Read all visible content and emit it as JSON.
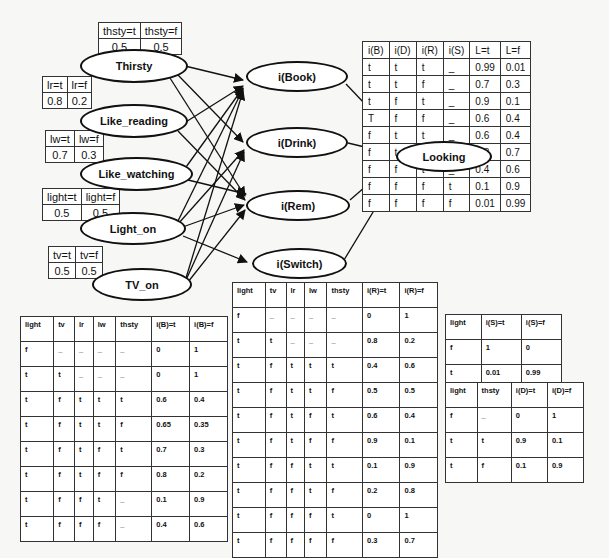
{
  "diagram": {
    "type": "bayesian_network",
    "nodes": {
      "thirsty": "Thirsty",
      "like_reading": "Like_reading",
      "like_watching": "Like_watching",
      "light_on": "Light_on",
      "tv_on": "TV_on",
      "i_book": "i(Book)",
      "i_drink": "i(Drink)",
      "i_rem": "i(Rem)",
      "i_switch": "i(Switch)",
      "looking": "Looking"
    },
    "edges": [
      [
        "Thirsty",
        "i(Book)"
      ],
      [
        "Thirsty",
        "i(Drink)"
      ],
      [
        "Thirsty",
        "i(Rem)"
      ],
      [
        "Like_reading",
        "i(Book)"
      ],
      [
        "Like_reading",
        "i(Rem)"
      ],
      [
        "Like_watching",
        "i(Book)"
      ],
      [
        "Like_watching",
        "i(Rem)"
      ],
      [
        "Light_on",
        "i(Book)"
      ],
      [
        "Light_on",
        "i(Drink)"
      ],
      [
        "Light_on",
        "i(Rem)"
      ],
      [
        "Light_on",
        "i(Switch)"
      ],
      [
        "TV_on",
        "i(Book)"
      ],
      [
        "TV_on",
        "i(Drink)"
      ],
      [
        "TV_on",
        "i(Rem)"
      ],
      [
        "i(Book)",
        "Looking"
      ],
      [
        "i(Drink)",
        "Looking"
      ],
      [
        "i(Rem)",
        "Looking"
      ],
      [
        "i(Switch)",
        "Looking"
      ]
    ]
  },
  "priors": {
    "thirsty": {
      "headers": [
        "thsty=t",
        "thsty=f"
      ],
      "values": [
        "0.5",
        "0.5"
      ]
    },
    "like_reading": {
      "headers": [
        "lr=t",
        "lr=f"
      ],
      "values": [
        "0.8",
        "0.2"
      ]
    },
    "like_watching": {
      "headers": [
        "lw=t",
        "lw=f"
      ],
      "values": [
        "0.7",
        "0.3"
      ]
    },
    "light_on": {
      "headers": [
        "light=t",
        "light=f"
      ],
      "values": [
        "0.5",
        "0.5"
      ]
    },
    "tv_on": {
      "headers": [
        "tv=t",
        "tv=f"
      ],
      "values": [
        "0.5",
        "0.5"
      ]
    }
  },
  "looking_table": {
    "headers": [
      "i(B)",
      "i(D)",
      "i(R)",
      "i(S)",
      "L=t",
      "L=f"
    ],
    "rows": [
      [
        "t",
        "t",
        "t",
        "_",
        "0.99",
        "0.01"
      ],
      [
        "t",
        "t",
        "f",
        "_",
        "0.7",
        "0.3"
      ],
      [
        "t",
        "f",
        "t",
        "_",
        "0.9",
        "0.1"
      ],
      [
        "T",
        "f",
        "f",
        "_",
        "0.6",
        "0.4"
      ],
      [
        "f",
        "t",
        "t",
        "_",
        "0.6",
        "0.4"
      ],
      [
        "f",
        "t",
        "f",
        "_",
        "0.3",
        "0.7"
      ],
      [
        "f",
        "f",
        "t",
        "_",
        "0.4",
        "0.6"
      ],
      [
        "f",
        "f",
        "f",
        "t",
        "0.1",
        "0.9"
      ],
      [
        "f",
        "f",
        "f",
        "f",
        "0.01",
        "0.99"
      ]
    ]
  },
  "book_table": {
    "headers": [
      "light",
      "tv",
      "lr",
      "lw",
      "thsty",
      "i(B)=t",
      "i(B)=f"
    ],
    "rows": [
      [
        "f",
        "_",
        "_",
        "_",
        "_",
        "0",
        "1"
      ],
      [
        "t",
        "t",
        "_",
        "_",
        "_",
        "0",
        "1"
      ],
      [
        "t",
        "f",
        "t",
        "t",
        "t",
        "0.6",
        "0.4"
      ],
      [
        "t",
        "f",
        "t",
        "t",
        "f",
        "0.65",
        "0.35"
      ],
      [
        "t",
        "f",
        "t",
        "f",
        "t",
        "0.7",
        "0.3"
      ],
      [
        "t",
        "f",
        "t",
        "f",
        "f",
        "0.8",
        "0.2"
      ],
      [
        "t",
        "f",
        "f",
        "t",
        "_",
        "0.1",
        "0.9"
      ],
      [
        "t",
        "f",
        "f",
        "f",
        "_",
        "0.4",
        "0.6"
      ]
    ]
  },
  "rem_table": {
    "headers": [
      "light",
      "tv",
      "lr",
      "lw",
      "thsty",
      "i(R)=t",
      "i(R)=f"
    ],
    "rows": [
      [
        "f",
        "_",
        "_",
        "_",
        "_",
        "0",
        "1"
      ],
      [
        "t",
        "t",
        "_",
        "_",
        "_",
        "0.8",
        "0.2"
      ],
      [
        "t",
        "f",
        "t",
        "t",
        "t",
        "0.4",
        "0.6"
      ],
      [
        "t",
        "f",
        "t",
        "t",
        "f",
        "0.5",
        "0.5"
      ],
      [
        "t",
        "f",
        "t",
        "f",
        "t",
        "0.6",
        "0.4"
      ],
      [
        "t",
        "f",
        "t",
        "f",
        "f",
        "0.9",
        "0.1"
      ],
      [
        "t",
        "f",
        "f",
        "t",
        "t",
        "0.1",
        "0.9"
      ],
      [
        "t",
        "f",
        "f",
        "t",
        "f",
        "0.2",
        "0.8"
      ],
      [
        "t",
        "f",
        "f",
        "f",
        "t",
        "0",
        "1"
      ],
      [
        "t",
        "f",
        "f",
        "f",
        "f",
        "0.3",
        "0.7"
      ]
    ]
  },
  "switch_table": {
    "headers": [
      "light",
      "i(S)=t",
      "i(S)=f"
    ],
    "rows": [
      [
        "f",
        "1",
        "0"
      ],
      [
        "t",
        "0.01",
        "0.99"
      ]
    ]
  },
  "drink_table": {
    "headers": [
      "light",
      "thsty",
      "i(D)=t",
      "i(D)=f"
    ],
    "rows": [
      [
        "f",
        "_",
        "0",
        "1"
      ],
      [
        "t",
        "t",
        "0.9",
        "0.1"
      ],
      [
        "t",
        "f",
        "0.1",
        "0.9"
      ]
    ]
  }
}
